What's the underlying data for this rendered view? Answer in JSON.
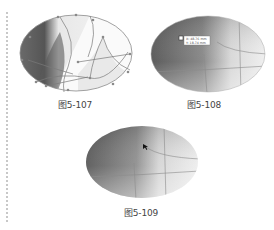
{
  "figures": [
    {
      "id": "fig-5-107",
      "caption": "图5-107",
      "description": "ellipse gradient mesh with editing paths and anchor points"
    },
    {
      "id": "fig-5-108",
      "caption": "图5-108",
      "description": "ellipse gradient mesh with mesh point tooltip"
    },
    {
      "id": "fig-5-109",
      "caption": "图5-109",
      "description": "ellipse gradient mesh with cursor"
    }
  ],
  "tooltip": {
    "line1": "X: 48.76 mm",
    "line2": "Y: 18.74 mm"
  },
  "colors": {
    "dark": "#4a4a4a",
    "light": "#f2f2f2",
    "path": "#8a8a8a",
    "caption": "#444444"
  }
}
